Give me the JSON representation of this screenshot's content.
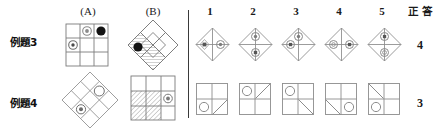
{
  "header": {
    "col_a": "(A)",
    "col_b": "(B)",
    "options": [
      "1",
      "2",
      "3",
      "4",
      "5"
    ],
    "answer_label": "正 答"
  },
  "rows": [
    {
      "label": "例題3",
      "answer": "4",
      "a_figure": {
        "kind": "grid3x3",
        "marks": [
          {
            "cell": "top-middle",
            "glyph": "ring"
          },
          {
            "cell": "top-right",
            "glyph": "filled-dot"
          },
          {
            "cell": "middle-left",
            "glyph": "ring"
          }
        ]
      },
      "b_figure": {
        "kind": "diamond4",
        "marks": [
          {
            "cell": "left",
            "glyph": "filled-dot"
          }
        ],
        "hatch": [
          "bottom",
          "left-lower"
        ]
      },
      "options": [
        {
          "kind": "diamond4",
          "marks": [
            {
              "cell": "left",
              "glyph": "dot"
            },
            {
              "cell": "right",
              "glyph": "ring"
            }
          ]
        },
        {
          "kind": "diamond4",
          "marks": [
            {
              "cell": "top",
              "glyph": "ring"
            },
            {
              "cell": "bottom",
              "glyph": "dot"
            }
          ]
        },
        {
          "kind": "diamond4",
          "marks": [
            {
              "cell": "top",
              "glyph": "ring"
            },
            {
              "cell": "left",
              "glyph": "dot"
            }
          ]
        },
        {
          "kind": "diamond4",
          "marks": [
            {
              "cell": "left",
              "glyph": "ring"
            },
            {
              "cell": "right",
              "glyph": "dot"
            }
          ]
        },
        {
          "kind": "diamond4",
          "marks": [
            {
              "cell": "top",
              "glyph": "dot"
            },
            {
              "cell": "bottom",
              "glyph": "ring"
            }
          ]
        }
      ]
    },
    {
      "label": "例題4",
      "answer": "3",
      "a_figure": {
        "kind": "diamond9",
        "marks": [
          {
            "cell": "upper-right",
            "glyph": "circle"
          },
          {
            "cell": "lower-left",
            "glyph": "ring"
          }
        ]
      },
      "b_figure": {
        "kind": "grid3x3",
        "marks": [
          {
            "cell": "middle-right",
            "glyph": "ring"
          }
        ],
        "hatch": [
          "middle-left",
          "middle-center",
          "bottom-left",
          "bottom-center"
        ]
      },
      "options": [
        {
          "kind": "grid2x2",
          "marks": [
            {
              "cell": "bottom-left",
              "glyph": "circle"
            }
          ],
          "diag": [
            {
              "cell": "bottom-right",
              "dir": "/"
            }
          ]
        },
        {
          "kind": "grid2x2",
          "marks": [
            {
              "cell": "top-left",
              "glyph": "circle"
            }
          ],
          "diag": [
            {
              "cell": "top-right",
              "dir": "/"
            }
          ]
        },
        {
          "kind": "grid2x2",
          "marks": [
            {
              "cell": "top-left",
              "glyph": "circle"
            }
          ],
          "diag": [
            {
              "cell": "bottom-right",
              "dir": "\\"
            }
          ]
        },
        {
          "kind": "grid2x2",
          "marks": [
            {
              "cell": "bottom-right",
              "glyph": "circle"
            }
          ],
          "diag": [
            {
              "cell": "bottom-left",
              "dir": "\\"
            }
          ]
        },
        {
          "kind": "grid2x2",
          "marks": [
            {
              "cell": "bottom-left",
              "glyph": "circle"
            }
          ],
          "diag": [
            {
              "cell": "top-left",
              "dir": "\\"
            }
          ]
        }
      ]
    }
  ],
  "colors": {
    "line": "#6f6f6f",
    "line_dark": "#3a3a3a",
    "fill_dot": "#111111",
    "text": "#1a1a1a"
  }
}
